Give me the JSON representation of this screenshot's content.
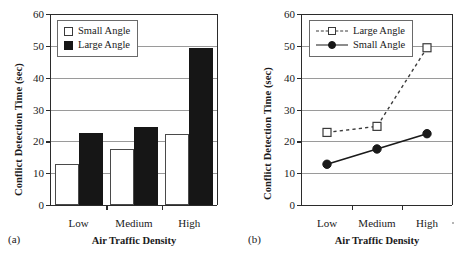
{
  "figure": {
    "background": "#ffffff",
    "ink": "#1a1a1a",
    "grid_color": "#9a9a9a"
  },
  "panels": [
    {
      "caption": "(a)",
      "chart_data": {
        "type": "bar",
        "title": "",
        "subtitle": "",
        "xlabel": "Air Traffic Density",
        "ylabel": "Conflict Detection Time (sec)",
        "categories": [
          "Low",
          "Medium",
          "High"
        ],
        "series": [
          {
            "name": "Small Angle",
            "values": [
              12.8,
              17.6,
              22.4
            ],
            "fill": "#ffffff",
            "edge": "#4a4a4a"
          },
          {
            "name": "Large Angle",
            "values": [
              22.7,
              24.5,
              49.4
            ],
            "fill": "#161616",
            "edge": "#161616"
          }
        ],
        "ylim": [
          0,
          60
        ],
        "yticks": [
          0,
          10,
          20,
          30,
          40,
          50,
          60
        ],
        "ytick_labels": [
          "0",
          "10",
          "20",
          "30",
          "40",
          "50",
          "60"
        ],
        "grid": true,
        "grid_axis": "y",
        "legend_position": "upper left",
        "legend_entries": [
          "Small Angle",
          "Large Angle"
        ]
      }
    },
    {
      "caption": "(b)",
      "chart_data": {
        "type": "line",
        "title": "",
        "subtitle": "",
        "xlabel": "Air Traffic Density",
        "ylabel": "Conflict Detection Time (sec)",
        "categories": [
          "Low",
          "Medium",
          "High"
        ],
        "series": [
          {
            "name": "Large Angle",
            "values": [
              22.8,
              24.7,
              49.4
            ],
            "linestyle": "dashed",
            "marker": "open-square",
            "color": "#3a3a3a"
          },
          {
            "name": "Small Angle",
            "values": [
              12.8,
              17.6,
              22.4
            ],
            "linestyle": "solid",
            "marker": "filled-circle",
            "color": "#1a1a1a"
          }
        ],
        "ylim": [
          0,
          60
        ],
        "yticks": [
          0,
          10,
          20,
          30,
          40,
          50,
          60
        ],
        "ytick_labels": [
          "0",
          "10",
          "20",
          "30",
          "40",
          "50",
          "60"
        ],
        "grid": true,
        "grid_axis": "y",
        "legend_position": "upper left",
        "legend_entries": [
          "Large Angle",
          "Small Angle"
        ]
      }
    }
  ]
}
